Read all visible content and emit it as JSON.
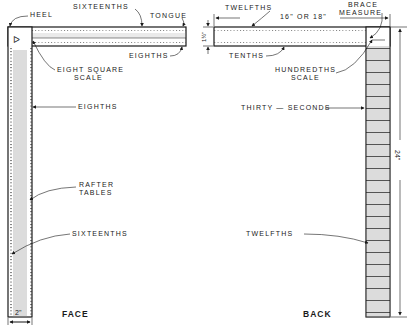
{
  "face": {
    "caption": "FACE",
    "labels": {
      "heel": "HEEL",
      "sixteenths_top": "SIXTEENTHS",
      "tongue": "TONGUE",
      "eighths_tongue": "EIGHTHS",
      "eight_square_1": "EIGHT SQUARE",
      "eight_square_2": "SCALE",
      "eighths_blade": "EIGHTHS",
      "rafter_1": "RAFTER",
      "rafter_2": "TABLES",
      "sixteenths_blade": "SIXTEENTHS",
      "width_dim": "2\""
    }
  },
  "back": {
    "caption": "BACK",
    "labels": {
      "twelfths_top": "TWELFTHS",
      "tongue_length": "16\" OR 18\"",
      "brace_1": "BRACE",
      "brace_2": "MEASURE",
      "tongue_width": "1½\"",
      "tenths": "TENTHS",
      "hundredths_1": "HUNDREDTHS",
      "hundredths_2": "SCALE",
      "thirty_seconds": "THIRTY — SECONDS",
      "blade_length": "24\"",
      "twelfths_blade": "TWELFTHS"
    }
  },
  "colors": {
    "ink": "#1a1a1a",
    "paper": "#ffffff",
    "hatch": "#8a8a8a"
  }
}
